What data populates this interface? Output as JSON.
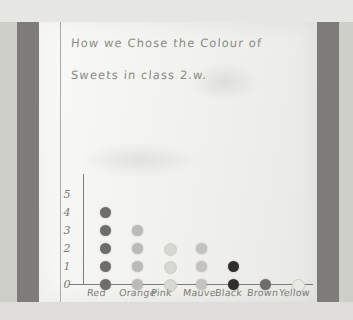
{
  "photo": {
    "subject": "hand-drawn pictogram on lined exercise-book paper",
    "paper_color": "#f2f2ef",
    "border_color": "#7d7c79",
    "pencil_color": "#7d7c79"
  },
  "title": {
    "line1": "How we Chose the Colour of",
    "line2": "Sweets in class 2.w."
  },
  "chart_data": {
    "type": "bar",
    "title": "How we Chose the Colour of Sweets in class 2.w.",
    "xlabel": "",
    "ylabel": "",
    "ylim": [
      0,
      5
    ],
    "grid": false,
    "legend": "none",
    "yticks": [
      "0",
      "1",
      "2",
      "3",
      "4",
      "5"
    ],
    "categories": [
      "Red",
      "Orange",
      "Pink",
      "Mauve",
      "Black",
      "Brown",
      "Yellow"
    ],
    "values": [
      5,
      4,
      3,
      3,
      2,
      1,
      1
    ],
    "marker": "circle-dot",
    "series_colors": [
      "#6e6d6a",
      "#bbbab6",
      "#d8d8d3",
      "#c4c3bf",
      "#2f2e2c",
      "#6d6c69",
      "#e9e9e4"
    ],
    "note": "one dot per child; dots stacked vertically per sweet colour"
  }
}
